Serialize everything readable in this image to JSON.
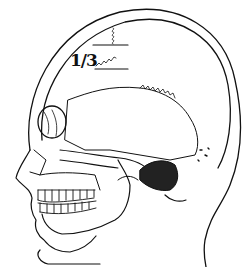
{
  "diagram": {
    "annotation": {
      "fraction_label": "1/3",
      "numerator": "1",
      "denominator": "3"
    },
    "colors": {
      "line": "#111111",
      "background": "#ffffff"
    }
  }
}
